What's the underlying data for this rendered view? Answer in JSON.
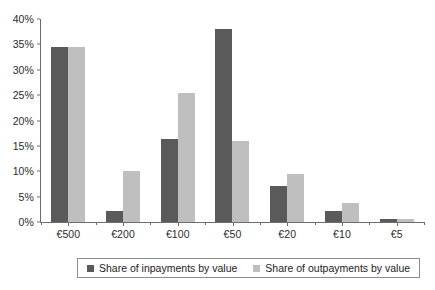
{
  "chart_data": {
    "type": "bar",
    "title": "",
    "xlabel": "",
    "ylabel": "",
    "ylim": [
      0,
      40
    ],
    "ytick_values": [
      0,
      5,
      10,
      15,
      20,
      25,
      30,
      35,
      40
    ],
    "ytick_labels": [
      "0%",
      "5%",
      "10%",
      "15%",
      "20%",
      "25%",
      "30%",
      "35%",
      "40%"
    ],
    "grid": false,
    "legend_position": "bottom",
    "categories": [
      "€500",
      "€200",
      "€100",
      "€50",
      "€20",
      "€10",
      "€5"
    ],
    "series": [
      {
        "name": "Share of inpayments by value",
        "color": "#5a5a5a",
        "values": [
          34.4,
          2.1,
          16.3,
          38.0,
          7.0,
          2.2,
          0.5
        ]
      },
      {
        "name": "Share of outpayments by value",
        "color": "#bfbfbf",
        "values": [
          34.5,
          10.0,
          25.5,
          16.0,
          9.5,
          3.7,
          0.5
        ]
      }
    ]
  },
  "axis": {
    "line_color": "#6d6d6d"
  },
  "background": "#ffffff"
}
